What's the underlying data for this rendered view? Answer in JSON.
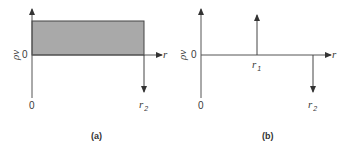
{
  "panels": [
    {
      "id": "a",
      "caption": "(a)",
      "y_axis_label": "ρv",
      "y_zero_label": "0",
      "x_axis_label": "r",
      "origin_label": "0",
      "marker_label_main": "r",
      "marker_label_sub": "2",
      "shaded_region": {
        "from": "0",
        "to": "r2",
        "fill": "#a9a9a9"
      }
    },
    {
      "id": "b",
      "caption": "(b)",
      "y_axis_label": "ρv",
      "y_zero_label": "0",
      "x_axis_label": "r",
      "origin_label": "0",
      "impulse_up_label_main": "r",
      "impulse_up_label_sub": "1",
      "impulse_down_label_main": "r",
      "impulse_down_label_sub": "2"
    }
  ],
  "colors": {
    "axis": "#555555",
    "fill": "#a9a9a9",
    "fill_border": "#444444"
  }
}
